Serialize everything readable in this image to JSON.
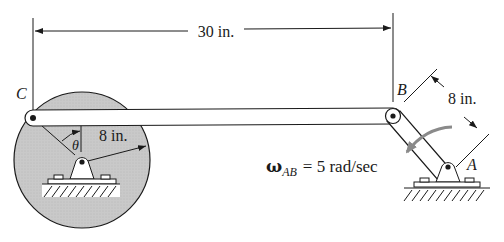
{
  "diagram": {
    "dimension_top": "30 in.",
    "dimension_crank": "8 in.",
    "dimension_link_ab": "8 in.",
    "point_c": "C",
    "point_b": "B",
    "point_a": "A",
    "angle_label": "θ",
    "omega_symbol": "ω",
    "omega_subscript": "AB",
    "omega_value": "= 5 rad/sec"
  },
  "colors": {
    "disk_fill": "#c8c8c8",
    "line": "#1a1a1a",
    "arrow_gray": "#8a8a8a"
  }
}
